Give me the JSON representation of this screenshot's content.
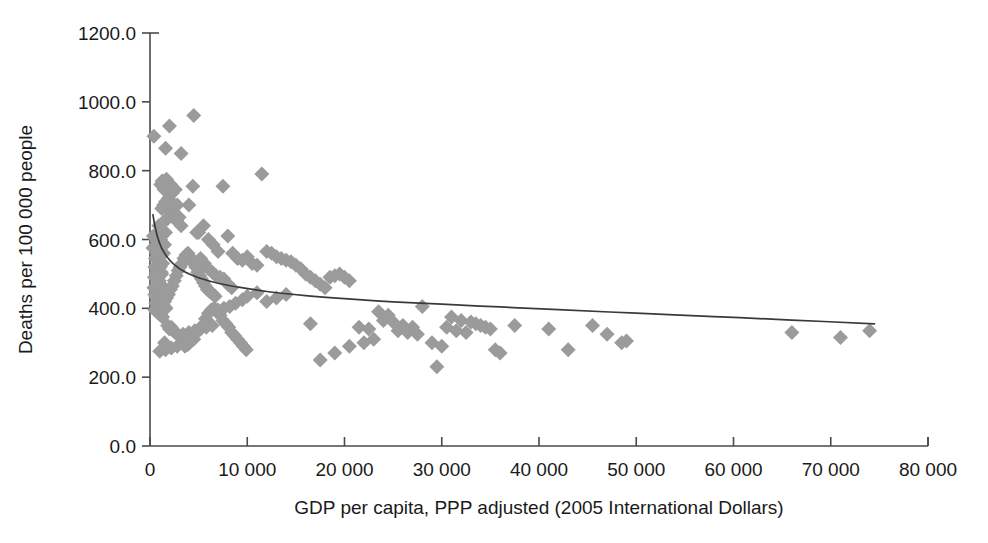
{
  "chart_data": {
    "type": "scatter",
    "title": "",
    "xlabel": "GDP per capita, PPP adjusted (2005 International Dollars)",
    "ylabel": "Deaths per 100 000 people",
    "xlim": [
      0,
      80000
    ],
    "ylim": [
      0,
      1200
    ],
    "grid": false,
    "legend": null,
    "xticks": [
      0,
      10000,
      20000,
      30000,
      40000,
      50000,
      60000,
      70000,
      80000
    ],
    "xticklabels": [
      "0",
      "10 000",
      "20 000",
      "30 000",
      "40 000",
      "50 000",
      "60 000",
      "70 000",
      "80 000"
    ],
    "yticks": [
      0,
      200,
      400,
      600,
      800,
      1000,
      1200
    ],
    "yticklabels": [
      "0.0",
      "200.0",
      "400.0",
      "600.0",
      "800.0",
      "1000.0",
      "1200.0"
    ],
    "marker_shape": "diamond",
    "marker_color": "#9b9b9b",
    "trendline_color": "#3a3a3a",
    "trendline_type": "logarithmic",
    "points": [
      [
        400,
        900
      ],
      [
        600,
        600
      ],
      [
        700,
        560
      ],
      [
        500,
        520
      ],
      [
        450,
        490
      ],
      [
        800,
        470
      ],
      [
        900,
        455
      ],
      [
        350,
        610
      ],
      [
        300,
        575
      ],
      [
        550,
        545
      ],
      [
        650,
        505
      ],
      [
        750,
        480
      ],
      [
        1000,
        465
      ],
      [
        1100,
        450
      ],
      [
        900,
        430
      ],
      [
        600,
        415
      ],
      [
        500,
        440
      ],
      [
        400,
        460
      ],
      [
        1200,
        500
      ],
      [
        1300,
        530
      ],
      [
        1400,
        560
      ],
      [
        1500,
        585
      ],
      [
        1600,
        620
      ],
      [
        1700,
        660
      ],
      [
        1800,
        690
      ],
      [
        1900,
        720
      ],
      [
        2000,
        745
      ],
      [
        2100,
        760
      ],
      [
        2200,
        755
      ],
      [
        2300,
        735
      ],
      [
        2400,
        700
      ],
      [
        1500,
        770
      ],
      [
        1700,
        775
      ],
      [
        1900,
        765
      ],
      [
        2600,
        745
      ],
      [
        2800,
        700
      ],
      [
        3000,
        665
      ],
      [
        3200,
        640
      ],
      [
        2500,
        670
      ],
      [
        2700,
        655
      ],
      [
        1100,
        760
      ],
      [
        1300,
        755
      ],
      [
        1250,
        770
      ],
      [
        1450,
        745
      ],
      [
        2000,
        930
      ],
      [
        3200,
        850
      ],
      [
        4500,
        960
      ],
      [
        1600,
        865
      ],
      [
        1200,
        690
      ],
      [
        1400,
        700
      ],
      [
        1600,
        710
      ],
      [
        1800,
        660
      ],
      [
        900,
        640
      ],
      [
        1000,
        620
      ],
      [
        1100,
        600
      ],
      [
        1250,
        580
      ],
      [
        800,
        560
      ],
      [
        950,
        540
      ],
      [
        1050,
        520
      ],
      [
        1150,
        505
      ],
      [
        700,
        500
      ],
      [
        850,
        490
      ],
      [
        950,
        480
      ],
      [
        1100,
        470
      ],
      [
        1250,
        460
      ],
      [
        1400,
        450
      ],
      [
        1550,
        445
      ],
      [
        1700,
        440
      ],
      [
        600,
        435
      ],
      [
        750,
        430
      ],
      [
        900,
        425
      ],
      [
        1050,
        420
      ],
      [
        1200,
        415
      ],
      [
        1350,
        410
      ],
      [
        1500,
        405
      ],
      [
        1650,
        400
      ],
      [
        500,
        395
      ],
      [
        700,
        390
      ],
      [
        900,
        385
      ],
      [
        1100,
        380
      ],
      [
        1300,
        375
      ],
      [
        1500,
        420
      ],
      [
        1700,
        430
      ],
      [
        1900,
        440
      ],
      [
        2100,
        455
      ],
      [
        2300,
        465
      ],
      [
        2500,
        480
      ],
      [
        2700,
        495
      ],
      [
        2900,
        510
      ],
      [
        3100,
        520
      ],
      [
        3300,
        530
      ],
      [
        3500,
        545
      ],
      [
        3700,
        555
      ],
      [
        3900,
        560
      ],
      [
        4100,
        550
      ],
      [
        4300,
        540
      ],
      [
        4500,
        530
      ],
      [
        4700,
        520
      ],
      [
        4900,
        505
      ],
      [
        5100,
        495
      ],
      [
        5300,
        485
      ],
      [
        5500,
        475
      ],
      [
        5700,
        465
      ],
      [
        5900,
        455
      ],
      [
        6100,
        450
      ],
      [
        6300,
        445
      ],
      [
        6500,
        440
      ],
      [
        6700,
        435
      ],
      [
        2200,
        345
      ],
      [
        2400,
        335
      ],
      [
        2600,
        330
      ],
      [
        2800,
        325
      ],
      [
        3000,
        320
      ],
      [
        3300,
        300
      ],
      [
        3600,
        290
      ],
      [
        3900,
        295
      ],
      [
        1800,
        350
      ],
      [
        2000,
        340
      ],
      [
        1500,
        300
      ],
      [
        1700,
        290
      ],
      [
        4200,
        305
      ],
      [
        4500,
        310
      ],
      [
        4800,
        330
      ],
      [
        5100,
        340
      ],
      [
        5400,
        350
      ],
      [
        5700,
        370
      ],
      [
        6000,
        385
      ],
      [
        6300,
        395
      ],
      [
        6600,
        400
      ],
      [
        6900,
        390
      ],
      [
        7200,
        380
      ],
      [
        7500,
        365
      ],
      [
        7800,
        355
      ],
      [
        8100,
        345
      ],
      [
        8400,
        330
      ],
      [
        8700,
        320
      ],
      [
        9000,
        310
      ],
      [
        9300,
        300
      ],
      [
        9600,
        290
      ],
      [
        9900,
        280
      ],
      [
        5000,
        620
      ],
      [
        5500,
        640
      ],
      [
        6000,
        600
      ],
      [
        6500,
        585
      ],
      [
        7000,
        565
      ],
      [
        7500,
        755
      ],
      [
        8000,
        610
      ],
      [
        8500,
        560
      ],
      [
        9000,
        545
      ],
      [
        9500,
        540
      ],
      [
        10000,
        550
      ],
      [
        10500,
        530
      ],
      [
        11000,
        525
      ],
      [
        11500,
        790
      ],
      [
        12000,
        565
      ],
      [
        12500,
        560
      ],
      [
        4000,
        700
      ],
      [
        4400,
        755
      ],
      [
        4800,
        620
      ],
      [
        5200,
        545
      ],
      [
        5600,
        530
      ],
      [
        6000,
        515
      ],
      [
        6400,
        505
      ],
      [
        6800,
        495
      ],
      [
        7200,
        490
      ],
      [
        7600,
        485
      ],
      [
        8000,
        470
      ],
      [
        8400,
        460
      ],
      [
        13000,
        550
      ],
      [
        13500,
        545
      ],
      [
        14000,
        540
      ],
      [
        14500,
        535
      ],
      [
        15000,
        525
      ],
      [
        15500,
        515
      ],
      [
        16000,
        500
      ],
      [
        16500,
        490
      ],
      [
        17000,
        480
      ],
      [
        17500,
        470
      ],
      [
        18000,
        460
      ],
      [
        18500,
        490
      ],
      [
        19000,
        495
      ],
      [
        19500,
        500
      ],
      [
        20000,
        490
      ],
      [
        20500,
        480
      ],
      [
        16500,
        355
      ],
      [
        17500,
        250
      ],
      [
        19000,
        270
      ],
      [
        20500,
        290
      ],
      [
        22000,
        300
      ],
      [
        23000,
        310
      ],
      [
        24000,
        365
      ],
      [
        25000,
        360
      ],
      [
        26000,
        350
      ],
      [
        27000,
        345
      ],
      [
        28000,
        405
      ],
      [
        29000,
        300
      ],
      [
        29500,
        230
      ],
      [
        30000,
        290
      ],
      [
        31000,
        375
      ],
      [
        32000,
        365
      ],
      [
        33000,
        360
      ],
      [
        33500,
        355
      ],
      [
        34000,
        350
      ],
      [
        34500,
        345
      ],
      [
        35000,
        340
      ],
      [
        35500,
        280
      ],
      [
        36000,
        270
      ],
      [
        37500,
        350
      ],
      [
        41000,
        340
      ],
      [
        43000,
        280
      ],
      [
        45500,
        350
      ],
      [
        47000,
        325
      ],
      [
        48500,
        300
      ],
      [
        49000,
        305
      ],
      [
        66000,
        330
      ],
      [
        71000,
        315
      ],
      [
        74000,
        335
      ],
      [
        23500,
        390
      ],
      [
        24500,
        380
      ],
      [
        25500,
        335
      ],
      [
        26500,
        330
      ],
      [
        27500,
        325
      ],
      [
        21500,
        345
      ],
      [
        22500,
        340
      ],
      [
        30500,
        345
      ],
      [
        31500,
        335
      ],
      [
        32500,
        330
      ],
      [
        12000,
        420
      ],
      [
        13000,
        430
      ],
      [
        14000,
        440
      ],
      [
        11000,
        445
      ],
      [
        10000,
        435
      ],
      [
        9500,
        425
      ],
      [
        8800,
        415
      ],
      [
        8200,
        405
      ],
      [
        7600,
        400
      ],
      [
        7000,
        395
      ],
      [
        6400,
        350
      ],
      [
        5800,
        345
      ],
      [
        5200,
        340
      ],
      [
        4600,
        335
      ],
      [
        4000,
        330
      ],
      [
        3400,
        325
      ],
      [
        2800,
        290
      ],
      [
        2200,
        285
      ],
      [
        1600,
        280
      ],
      [
        1000,
        275
      ]
    ],
    "trendline": {
      "x_start": 300,
      "x_end": 74500,
      "formula_points": [
        [
          300,
          672
        ],
        [
          500,
          640
        ],
        [
          800,
          605
        ],
        [
          1200,
          575
        ],
        [
          1800,
          548
        ],
        [
          2500,
          527
        ],
        [
          3500,
          507
        ],
        [
          5000,
          489
        ],
        [
          7000,
          473
        ],
        [
          9000,
          462
        ],
        [
          12000,
          449
        ],
        [
          16000,
          437
        ],
        [
          20000,
          428
        ],
        [
          25000,
          419
        ],
        [
          30000,
          412
        ],
        [
          36000,
          404
        ],
        [
          42000,
          396
        ],
        [
          50000,
          386
        ],
        [
          58000,
          376
        ],
        [
          66000,
          366
        ],
        [
          74500,
          355
        ]
      ]
    }
  }
}
